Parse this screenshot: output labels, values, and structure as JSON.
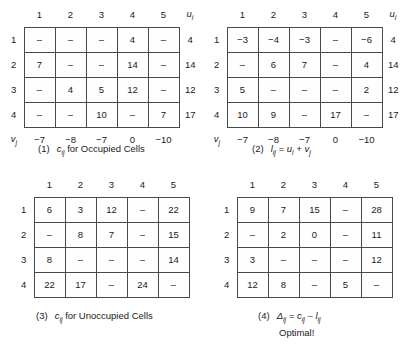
{
  "figure": {
    "columns": [
      "1",
      "2",
      "3",
      "4",
      "5"
    ],
    "rows": [
      "1",
      "2",
      "3",
      "4"
    ],
    "u_header": "u",
    "u_header_sub": "i",
    "v_header": "v",
    "v_header_sub": "j",
    "optimal_note": "Optimal!"
  },
  "tables": [
    {
      "id": "table-1-occupied",
      "number": "(1)",
      "caption_main": "c",
      "caption_sub": "ij",
      "caption_rest": " for Occupied Cells",
      "has_u_column": true,
      "has_v_row": true,
      "col_labels": [
        "1",
        "2",
        "3",
        "4",
        "5"
      ],
      "row_labels": [
        "1",
        "2",
        "3",
        "4"
      ],
      "cells": [
        [
          "–",
          "–",
          "–",
          "4",
          "–"
        ],
        [
          "7",
          "–",
          "–",
          "14",
          "–"
        ],
        [
          "–",
          "4",
          "5",
          "12",
          "–"
        ],
        [
          "–",
          "–",
          "10",
          "–",
          "7"
        ]
      ],
      "u_values": [
        "4",
        "14",
        "12",
        "17"
      ],
      "v_values": [
        "−7",
        "−8",
        "−7",
        "0",
        "−10"
      ]
    },
    {
      "id": "table-2-lij",
      "number": "(2)",
      "caption_main": "l",
      "caption_sub": "ij",
      "caption_rest": " = u",
      "caption_sub2": "i",
      "caption_rest2": " + v",
      "caption_sub3": "j",
      "has_u_column": true,
      "has_v_row": true,
      "col_labels": [
        "1",
        "2",
        "3",
        "4",
        "5"
      ],
      "row_labels": [
        "1",
        "2",
        "3",
        "4"
      ],
      "cells": [
        [
          "−3",
          "−4",
          "−3",
          "–",
          "−6"
        ],
        [
          "–",
          "6",
          "7",
          "–",
          "4"
        ],
        [
          "5",
          "–",
          "–",
          "–",
          "2"
        ],
        [
          "10",
          "9",
          "–",
          "17",
          "–"
        ]
      ],
      "u_values": [
        "4",
        "14",
        "12",
        "17"
      ],
      "v_values": [
        "−7",
        "−8",
        "−7",
        "0",
        "−10"
      ]
    },
    {
      "id": "table-3-unoccupied",
      "number": "(3)",
      "caption_main": "c",
      "caption_sub": "ij",
      "caption_rest": " for Unoccupied Cells",
      "has_u_column": false,
      "has_v_row": false,
      "col_labels": [
        "1",
        "2",
        "3",
        "4",
        "5"
      ],
      "row_labels": [
        "1",
        "2",
        "3",
        "4"
      ],
      "cells": [
        [
          "6",
          "3",
          "12",
          "–",
          "22"
        ],
        [
          "–",
          "8",
          "7",
          "–",
          "15"
        ],
        [
          "8",
          "–",
          "–",
          "–",
          "14"
        ],
        [
          "22",
          "17",
          "–",
          "24",
          "–"
        ]
      ]
    },
    {
      "id": "table-4-delta",
      "number": "(4)",
      "caption_main": "Δ",
      "caption_sub": "ij",
      "caption_rest": " = c",
      "caption_sub2": "ij",
      "caption_rest2": " – l",
      "caption_sub3": "ij",
      "has_u_column": false,
      "has_v_row": false,
      "col_labels": [
        "1",
        "2",
        "3",
        "4",
        "5"
      ],
      "row_labels": [
        "1",
        "2",
        "3",
        "4"
      ],
      "cells": [
        [
          "9",
          "7",
          "15",
          "–",
          "28"
        ],
        [
          "–",
          "2",
          "0",
          "–",
          "11"
        ],
        [
          "3",
          "–",
          "–",
          "–",
          "12"
        ],
        [
          "12",
          "8",
          "–",
          "5",
          "–"
        ]
      ]
    }
  ]
}
